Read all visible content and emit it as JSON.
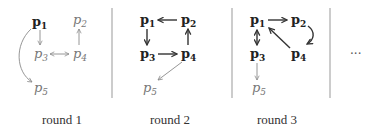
{
  "panels": [
    {
      "caption": "round 1",
      "nodes": [
        {
          "id": "p1",
          "base": "p",
          "sub": "1",
          "style": "bold"
        },
        {
          "id": "p2",
          "base": "p",
          "sub": "2",
          "style": "light"
        },
        {
          "id": "p3",
          "base": "p",
          "sub": "3",
          "style": "light"
        },
        {
          "id": "p4",
          "base": "p",
          "sub": "4",
          "style": "light"
        },
        {
          "id": "p5",
          "base": "p",
          "sub": "5",
          "style": "light"
        }
      ],
      "edges": [
        {
          "from": "p1",
          "to": "p3",
          "style": "thin"
        },
        {
          "from": "p1",
          "to": "p5",
          "style": "thin",
          "curved": true
        },
        {
          "from": "p3",
          "to": "p4",
          "style": "thin",
          "bidirectional": true
        },
        {
          "from": "p4",
          "to": "p2",
          "style": "thin"
        }
      ]
    },
    {
      "caption": "round 2",
      "nodes": [
        {
          "id": "p1",
          "base": "p",
          "sub": "1",
          "style": "bold"
        },
        {
          "id": "p2",
          "base": "p",
          "sub": "2",
          "style": "bold"
        },
        {
          "id": "p3",
          "base": "p",
          "sub": "3",
          "style": "bold"
        },
        {
          "id": "p4",
          "base": "p",
          "sub": "4",
          "style": "bold"
        },
        {
          "id": "p5",
          "base": "p",
          "sub": "5",
          "style": "light"
        }
      ],
      "edges": [
        {
          "from": "p2",
          "to": "p1",
          "style": "thick"
        },
        {
          "from": "p1",
          "to": "p3",
          "style": "thick"
        },
        {
          "from": "p3",
          "to": "p4",
          "style": "thick"
        },
        {
          "from": "p4",
          "to": "p2",
          "style": "thick"
        },
        {
          "from": "p4",
          "to": "p5",
          "style": "thin"
        }
      ]
    },
    {
      "caption": "round 3",
      "nodes": [
        {
          "id": "p1",
          "base": "p",
          "sub": "1",
          "style": "bold"
        },
        {
          "id": "p2",
          "base": "p",
          "sub": "2",
          "style": "bold"
        },
        {
          "id": "p3",
          "base": "p",
          "sub": "3",
          "style": "bold"
        },
        {
          "id": "p4",
          "base": "p",
          "sub": "4",
          "style": "bold"
        },
        {
          "id": "p5",
          "base": "p",
          "sub": "5",
          "style": "light"
        }
      ],
      "edges": [
        {
          "from": "p1",
          "to": "p2",
          "style": "thick"
        },
        {
          "from": "p1",
          "to": "p3",
          "style": "thick",
          "bidirectional": true
        },
        {
          "from": "p4",
          "to": "p1",
          "style": "thick"
        },
        {
          "from": "p2",
          "to": "p4",
          "style": "thick",
          "curved": true
        },
        {
          "from": "p3",
          "to": "p5",
          "style": "thin"
        }
      ]
    }
  ],
  "ellipsis": "···",
  "colors": {
    "bold_node": "#222222",
    "light_node": "#777777",
    "thin_edge": "#8a8a8a",
    "thick_edge": "#333333"
  }
}
